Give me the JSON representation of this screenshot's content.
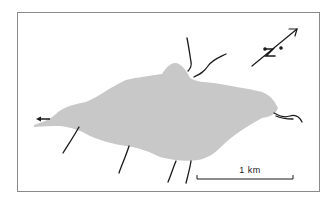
{
  "map": {
    "feature": "lake",
    "fill_color": "#c8c8c8",
    "line_color": "#1a1a1a",
    "frame_color": "#8a8a8a"
  },
  "scale_bar": {
    "label": "1 km"
  },
  "north_arrow": {
    "label": "N"
  },
  "outflow_arrow": {
    "direction": "west"
  },
  "streams": {
    "count": 8
  }
}
